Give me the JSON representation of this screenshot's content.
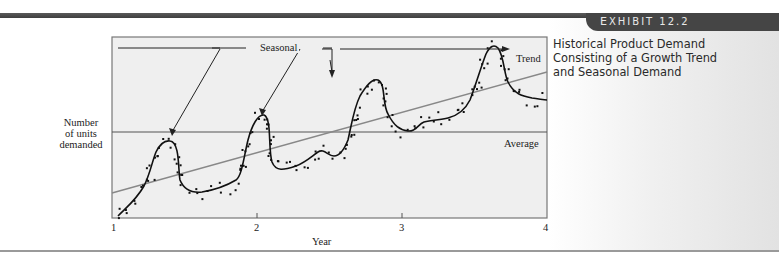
{
  "exhibit": {
    "label_prefix": "E",
    "label_rest": "XHIBIT 12.2"
  },
  "title_lines": [
    "Historical Product Demand",
    "Consisting of a Growth Trend",
    "and Seasonal Demand"
  ],
  "axis": {
    "ylabel_lines": [
      "Number",
      "of units",
      "demanded"
    ],
    "xlabel": "Year",
    "ticks": [
      "1",
      "2",
      "3",
      "4"
    ]
  },
  "annotations": {
    "seasonal": "Seasonal",
    "trend": "Trend",
    "average": "Average"
  },
  "colors": {
    "plot_bg": "#efefef",
    "curve": "#111111",
    "trend": "#777777",
    "average": "#555555",
    "band": "#454545"
  },
  "chart_data": {
    "type": "line",
    "title": "Historical Product Demand Consisting of a Growth Trend and Seasonal Demand",
    "xlabel": "Year",
    "ylabel": "Number of units demanded",
    "xlim": [
      1,
      4
    ],
    "x_ticks": [
      1,
      2,
      3,
      4
    ],
    "y_ticks": [],
    "grid": false,
    "series": [
      {
        "name": "Seasonal demand (smoothed)",
        "style": "solid-black-curve",
        "x": [
          1.0,
          1.1,
          1.2,
          1.3,
          1.4,
          1.5,
          1.6,
          1.7,
          1.8,
          1.9,
          2.0,
          2.1,
          2.2,
          2.3,
          2.4,
          2.5,
          2.6,
          2.7,
          2.8,
          2.9,
          3.0,
          3.1,
          3.2,
          3.3,
          3.4,
          3.5,
          3.6,
          3.7,
          3.8,
          3.9,
          4.0
        ],
        "y": [
          2,
          10,
          20,
          48,
          54,
          22,
          18,
          22,
          28,
          34,
          60,
          68,
          32,
          36,
          42,
          46,
          52,
          78,
          86,
          60,
          54,
          58,
          62,
          66,
          72,
          98,
          100,
          82,
          66,
          64,
          62
        ]
      },
      {
        "name": "Trend",
        "style": "gray-straight-line",
        "x": [
          1,
          4
        ],
        "y": [
          14,
          80
        ]
      },
      {
        "name": "Average",
        "style": "horizontal-line",
        "x": [
          1,
          4
        ],
        "y": [
          47,
          47
        ]
      },
      {
        "name": "Observed demand",
        "style": "scatter-dots",
        "note": "noisy points scattered around the seasonal curve"
      }
    ],
    "annotations": [
      "Seasonal (arrows to 4 seasonal peaks)",
      "Trend",
      "Average"
    ]
  }
}
